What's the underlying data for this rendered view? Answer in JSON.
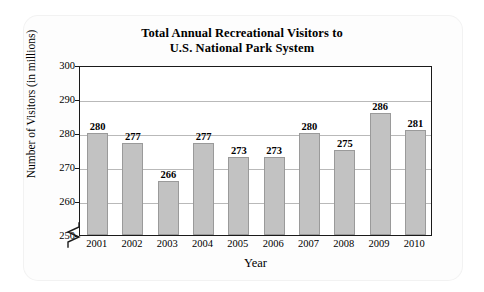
{
  "chart_data": {
    "type": "bar",
    "title": "Total Annual Recreational Visitors to U.S. National Park System",
    "title_line1": "Total Annual Recreational Visitors to",
    "title_line2": "U.S. National Park System",
    "xlabel": "Year",
    "ylabel": "Number of Visitors (in millions)",
    "categories": [
      "2001",
      "2002",
      "2003",
      "2004",
      "2005",
      "2006",
      "2007",
      "2008",
      "2009",
      "2010"
    ],
    "values": [
      280,
      277,
      266,
      277,
      273,
      273,
      280,
      275,
      286,
      281
    ],
    "value_labels": [
      "280",
      "277",
      "266",
      "277",
      "273",
      "273",
      "280",
      "275",
      "286",
      "281"
    ],
    "ylim": [
      250,
      300
    ],
    "yticks": [
      250,
      260,
      270,
      280,
      290,
      300
    ],
    "ytick_labels": [
      "250",
      "260",
      "270",
      "280",
      "290",
      "300"
    ],
    "grid": true,
    "grid_axis": "y",
    "legend": false,
    "axis_break": true,
    "axis_break_note": "zigzag break on y-axis below 250",
    "bar_color": "#c2c2c2",
    "bar_edge_color": "#9a9a9a",
    "grid_color": "#b9b9b9",
    "frame_color": "#1a1a1a",
    "background_color": "#ffffff"
  }
}
